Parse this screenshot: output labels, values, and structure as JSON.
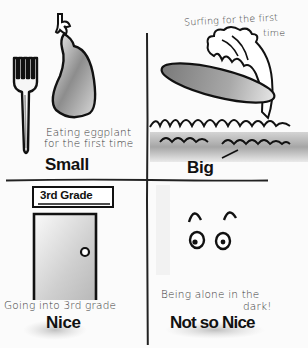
{
  "quadrants": {
    "top_left": {
      "caption_line1": "Eating eggplant",
      "caption_line2": "for the first time",
      "label": "Small",
      "illustrations": [
        "fork",
        "eggplant"
      ]
    },
    "top_right": {
      "caption_line1": "Surfing for the first",
      "caption_line2": "time",
      "label": "Big",
      "illustrations": [
        "surfboard",
        "wave"
      ]
    },
    "bottom_left": {
      "sign": "3rd Grade",
      "caption": "Going into 3rd grade",
      "label": "Nice",
      "illustrations": [
        "door",
        "sign"
      ]
    },
    "bottom_right": {
      "caption_line1": "Being alone in the",
      "caption_line2": "dark!",
      "label": "Not so Nice",
      "illustrations": [
        "eyes"
      ]
    }
  },
  "colors": {
    "ink": "#111111",
    "shade": "#9a9a9a",
    "paper": "#fbfbfb"
  }
}
